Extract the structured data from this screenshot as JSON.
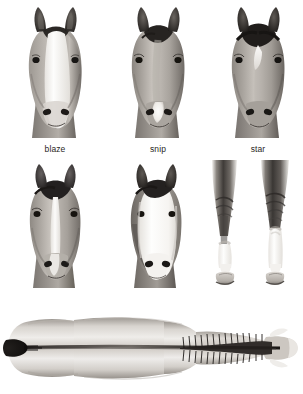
{
  "plate": {
    "title": "Horse markings",
    "background_color": "#ffffff",
    "label_color": "#2a2724",
    "art_style": "grayscale pencil / airbrush illustration",
    "rows": 3
  },
  "figures": [
    {
      "id": "blaze",
      "label": "blaze",
      "row": 1,
      "column": 1,
      "subject": "horse-head-front-view",
      "marking": "wide white stripe running the full length of the face from forehead to muzzle"
    },
    {
      "id": "snip",
      "label": "snip",
      "row": 1,
      "column": 2,
      "subject": "horse-head-front-view",
      "marking": "small white mark on the muzzle between the nostrils"
    },
    {
      "id": "star",
      "label": "star",
      "row": 1,
      "column": 3,
      "subject": "horse-head-front-view",
      "marking": "white mark on the forehead only"
    },
    {
      "id": "stripe",
      "label": "stripe",
      "row": 2,
      "column": 1,
      "subject": "horse-head-front-view",
      "marking": "narrow white line running down the centre of the face"
    },
    {
      "id": "white-face",
      "label": "white face",
      "row": 2,
      "column": 2,
      "subject": "horse-head-front-view",
      "marking": "entire front of the face is white"
    },
    {
      "id": "sock",
      "label": "sock",
      "row": 2,
      "column": 3,
      "subject": "horse-foreleg",
      "marking": "white marking on the lower leg just above the hoof, below the fetlock"
    },
    {
      "id": "stocking",
      "label": "stocking",
      "row": 2,
      "column": 4,
      "subject": "horse-foreleg",
      "marking": "white marking extending high up the leg toward the knee"
    },
    {
      "id": "dorsal-view",
      "label": "",
      "row": 3,
      "column": 1,
      "subject": "horse-body-top-view",
      "marking": "dorsal view of the horse showing the dark dorsal stripe along the spine and mane"
    }
  ]
}
